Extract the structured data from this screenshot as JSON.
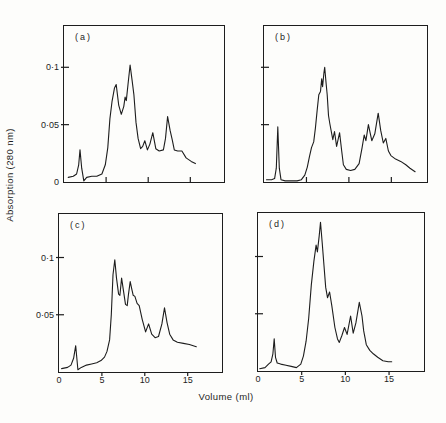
{
  "figure": {
    "ylabel": "Absorption (280 nm)",
    "xlabel": "Volume (ml)"
  },
  "chart_data": [
    {
      "type": "line",
      "panel": "a",
      "label": "(a)",
      "xlim": [
        0,
        19
      ],
      "ylim": [
        0,
        0.136
      ],
      "xticks": [
        5,
        10,
        15
      ],
      "yticks": [
        0.1,
        0.05
      ],
      "xtick_side": "inside",
      "xtick_labels": [],
      "ytick_labels": [
        {
          "v": 0.1,
          "t": "0·1"
        },
        {
          "v": 0.05,
          "t": "0·05"
        },
        {
          "v": 0,
          "t": "0"
        }
      ],
      "x": [
        0.5,
        1.1,
        1.5,
        1.75,
        1.9,
        2.1,
        2.35,
        2.7,
        3.3,
        3.9,
        4.5,
        4.9,
        5.2,
        5.45,
        5.7,
        6.0,
        6.2,
        6.5,
        6.8,
        7.1,
        7.25,
        7.4,
        7.6,
        7.85,
        8.1,
        8.3,
        8.55,
        8.8,
        9.1,
        9.35,
        9.6,
        9.9,
        10.2,
        10.55,
        10.9,
        11.3,
        11.8,
        12.05,
        12.3,
        12.6,
        12.85,
        13.1,
        13.5,
        14.0,
        14.5,
        15.1,
        15.6
      ],
      "y": [
        0.004,
        0.005,
        0.007,
        0.015,
        0.028,
        0.012,
        0.001,
        0.004,
        0.005,
        0.005,
        0.007,
        0.015,
        0.03,
        0.055,
        0.07,
        0.082,
        0.085,
        0.067,
        0.059,
        0.066,
        0.074,
        0.071,
        0.085,
        0.102,
        0.088,
        0.076,
        0.052,
        0.038,
        0.029,
        0.031,
        0.036,
        0.028,
        0.033,
        0.043,
        0.029,
        0.027,
        0.028,
        0.038,
        0.057,
        0.045,
        0.037,
        0.028,
        0.027,
        0.027,
        0.021,
        0.018,
        0.016
      ]
    },
    {
      "type": "line",
      "panel": "b",
      "label": "(b)",
      "xlim": [
        0,
        19.2
      ],
      "ylim": [
        0,
        0.136
      ],
      "xticks": [
        5,
        10,
        15
      ],
      "yticks": [
        0.1,
        0.05
      ],
      "xtick_side": "inside",
      "xtick_labels": [],
      "ytick_labels": [],
      "x": [
        0.3,
        0.9,
        1.25,
        1.45,
        1.62,
        1.8,
        2.0,
        2.5,
        3.2,
        3.9,
        4.4,
        4.8,
        5.1,
        5.35,
        5.6,
        5.85,
        6.05,
        6.25,
        6.45,
        6.65,
        6.8,
        6.9,
        7.05,
        7.15,
        7.3,
        7.45,
        7.6,
        7.75,
        7.95,
        8.1,
        8.3,
        8.55,
        8.9,
        9.15,
        9.35,
        9.7,
        10.2,
        10.7,
        11.2,
        11.55,
        11.8,
        12.0,
        12.3,
        12.7,
        13.05,
        13.45,
        13.75,
        14.05,
        14.35,
        14.65,
        14.95,
        15.5,
        16.1,
        16.7,
        17.2,
        17.8
      ],
      "y": [
        0.002,
        0.002,
        0.003,
        0.012,
        0.048,
        0.012,
        0.002,
        0.001,
        0.001,
        0.001,
        0.002,
        0.006,
        0.013,
        0.022,
        0.03,
        0.035,
        0.047,
        0.062,
        0.076,
        0.079,
        0.09,
        0.083,
        0.095,
        0.1,
        0.087,
        0.076,
        0.058,
        0.051,
        0.043,
        0.037,
        0.044,
        0.031,
        0.043,
        0.027,
        0.015,
        0.011,
        0.01,
        0.011,
        0.016,
        0.03,
        0.041,
        0.036,
        0.05,
        0.036,
        0.042,
        0.06,
        0.045,
        0.034,
        0.038,
        0.027,
        0.023,
        0.02,
        0.018,
        0.015,
        0.012,
        0.009
      ]
    },
    {
      "type": "line",
      "panel": "c",
      "label": "(c)",
      "xlim": [
        0,
        19
      ],
      "ylim": [
        0,
        0.138
      ],
      "xticks": [
        5,
        10,
        15
      ],
      "yticks": [
        0.1,
        0.05
      ],
      "xtick_side": "outside",
      "xtick_labels": [
        {
          "v": 0,
          "t": "0"
        },
        {
          "v": 5,
          "t": "5"
        },
        {
          "v": 10,
          "t": "10"
        },
        {
          "v": 15,
          "t": "15"
        }
      ],
      "ytick_labels": [
        {
          "v": 0.1,
          "t": "0·1"
        },
        {
          "v": 0.05,
          "t": "0·05"
        }
      ],
      "x": [
        0.3,
        1.0,
        1.4,
        1.7,
        1.95,
        2.2,
        2.6,
        3.2,
        3.8,
        4.4,
        4.9,
        5.3,
        5.6,
        5.9,
        6.1,
        6.3,
        6.5,
        6.7,
        6.95,
        7.1,
        7.3,
        7.5,
        7.75,
        7.95,
        8.1,
        8.3,
        8.5,
        8.65,
        8.85,
        9.1,
        9.35,
        9.7,
        10.1,
        10.45,
        10.8,
        11.2,
        11.6,
        12.0,
        12.3,
        12.6,
        12.9,
        13.3,
        13.8,
        14.5,
        15.2,
        16.0
      ],
      "y": [
        0.003,
        0.004,
        0.006,
        0.012,
        0.023,
        0.002,
        0.004,
        0.006,
        0.007,
        0.008,
        0.01,
        0.013,
        0.018,
        0.028,
        0.05,
        0.085,
        0.098,
        0.082,
        0.068,
        0.067,
        0.082,
        0.072,
        0.059,
        0.058,
        0.068,
        0.079,
        0.072,
        0.067,
        0.066,
        0.06,
        0.058,
        0.046,
        0.035,
        0.042,
        0.033,
        0.03,
        0.031,
        0.042,
        0.056,
        0.043,
        0.033,
        0.028,
        0.026,
        0.025,
        0.024,
        0.022
      ]
    },
    {
      "type": "line",
      "panel": "d",
      "label": "(d)",
      "xlim": [
        0,
        19
      ],
      "ylim": [
        0,
        0.138
      ],
      "xticks": [
        5,
        10,
        15
      ],
      "yticks": [
        0.1,
        0.05
      ],
      "xtick_side": "outside",
      "xtick_labels": [
        {
          "v": 0,
          "t": "0"
        },
        {
          "v": 5,
          "t": "5"
        },
        {
          "v": 10,
          "t": "10"
        },
        {
          "v": 15,
          "t": "15"
        }
      ],
      "ytick_labels": [],
      "x": [
        0.2,
        0.8,
        1.2,
        1.5,
        1.7,
        1.85,
        2.0,
        2.2,
        2.6,
        3.2,
        3.8,
        4.4,
        4.9,
        5.2,
        5.5,
        5.8,
        6.1,
        6.4,
        6.65,
        6.8,
        7.0,
        7.15,
        7.35,
        7.55,
        7.75,
        7.95,
        8.2,
        8.45,
        8.8,
        9.1,
        9.3,
        9.6,
        9.9,
        10.2,
        10.6,
        10.9,
        11.2,
        11.6,
        11.9,
        12.1,
        12.4,
        12.8,
        13.2,
        13.7,
        14.3,
        14.9,
        15.3
      ],
      "y": [
        0.002,
        0.003,
        0.006,
        0.008,
        0.015,
        0.028,
        0.012,
        0.007,
        0.006,
        0.005,
        0.004,
        0.003,
        0.006,
        0.013,
        0.026,
        0.046,
        0.075,
        0.096,
        0.11,
        0.104,
        0.118,
        0.13,
        0.112,
        0.092,
        0.073,
        0.064,
        0.069,
        0.057,
        0.038,
        0.028,
        0.025,
        0.031,
        0.038,
        0.032,
        0.048,
        0.033,
        0.042,
        0.06,
        0.048,
        0.035,
        0.023,
        0.018,
        0.015,
        0.012,
        0.009,
        0.008,
        0.008
      ]
    }
  ],
  "ink_color": "#1d1d1d"
}
